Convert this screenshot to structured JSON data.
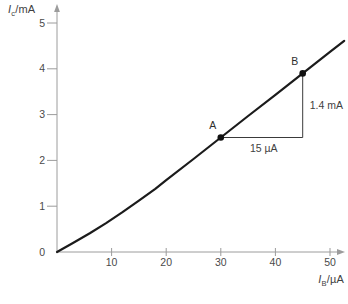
{
  "figure": {
    "ylabel": {
      "base": "I",
      "sub": "c",
      "rest": "/mA"
    },
    "xlabel": {
      "base": "I",
      "sub": "B",
      "rest": "/µA"
    }
  },
  "chart_data": {
    "type": "line",
    "title": "",
    "xlabel": "I_B/µA",
    "ylabel": "I_C/mA",
    "xlim": [
      0,
      52.6
    ],
    "ylim": [
      0,
      5.35
    ],
    "xticks": [
      10,
      20,
      30,
      40,
      50
    ],
    "yticks": [
      0,
      1,
      2,
      3,
      4,
      5
    ],
    "grid": false,
    "legend": "none",
    "series": [
      {
        "name": "I_C vs I_B transfer characteristic",
        "x": [
          0,
          3,
          6,
          9,
          12,
          15,
          18,
          20,
          25,
          30,
          35,
          40,
          45,
          50,
          52.6
        ],
        "y": [
          0,
          0.2,
          0.41,
          0.63,
          0.87,
          1.12,
          1.38,
          1.57,
          2.03,
          2.5,
          2.97,
          3.43,
          3.9,
          4.37,
          4.61
        ]
      }
    ],
    "points": [
      {
        "label": "A",
        "x": 30,
        "y": 2.5
      },
      {
        "label": "B",
        "x": 45,
        "y": 3.9
      }
    ],
    "slope_triangle": {
      "from": "A",
      "to": "B",
      "rise": 1.4,
      "rise_label": "1.4 mA",
      "run": 15,
      "run_label": "15 µA"
    },
    "colors": {
      "curve": "#1b1b1b",
      "axis": "#9c9c9c",
      "tick_text": "#4a4a4a",
      "annotation_line": "#3a3a3a",
      "point": "#111111",
      "background": "#ffffff"
    }
  }
}
